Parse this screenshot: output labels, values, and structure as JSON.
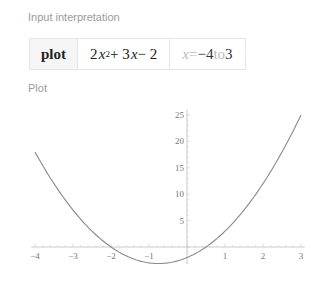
{
  "sections": {
    "input_label": "Input interpretation",
    "plot_label": "Plot"
  },
  "interpretation": {
    "command": "plot",
    "expr_coef1": "2",
    "expr_var1": "x",
    "expr_exp": "2",
    "expr_mid": " + 3",
    "expr_var2": "x",
    "expr_tail": " − 2",
    "range_var": "x",
    "range_eq": " = ",
    "range_from": "−4",
    "range_to_word": " to ",
    "range_to": "3"
  },
  "chart_data": {
    "type": "line",
    "title": "",
    "function": "2x^2 + 3x - 2",
    "xlabel": "",
    "ylabel": "",
    "xlim": [
      -4.1,
      3.1
    ],
    "ylim": [
      -3.2,
      26
    ],
    "grid": false,
    "x_ticks": [
      -4,
      -3,
      -2,
      -1,
      1,
      2,
      3
    ],
    "x_tick_labels": [
      "−4",
      "−3",
      "−2",
      "−1",
      "1",
      "2",
      "3"
    ],
    "y_ticks": [
      5,
      10,
      15,
      20,
      25
    ],
    "y_tick_labels": [
      "5",
      "10",
      "15",
      "20",
      "25"
    ],
    "series": [
      {
        "name": "2x^2 + 3x - 2",
        "x_range": [
          -4,
          3
        ],
        "color": "#8a8a8a"
      }
    ]
  }
}
